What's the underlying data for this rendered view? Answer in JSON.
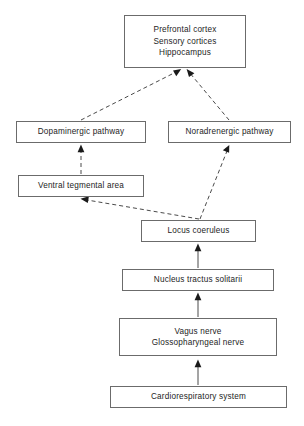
{
  "diagram": {
    "canvas": {
      "width": 304,
      "height": 426
    },
    "style": {
      "box_border_color": "#6b6b6b",
      "box_fill_color": "#ffffff",
      "text_color": "#1d1d1d",
      "edge_color": "#4a4a4a",
      "arrow_color": "#1a1a1a"
    },
    "nodes": [
      {
        "id": "cortex",
        "name": "cortical-targets",
        "lines": [
          "Prefrontal cortex",
          "Sensory cortices",
          "Hippocampus"
        ],
        "x": 124,
        "y": 15,
        "w": 122,
        "h": 53
      },
      {
        "id": "dopaminergic",
        "name": "dopaminergic-pathway",
        "lines": [
          "Dopaminergic pathway"
        ],
        "x": 16,
        "y": 121,
        "w": 130,
        "h": 22
      },
      {
        "id": "noradrenergic",
        "name": "noradrenergic-pathway",
        "lines": [
          "Noradrenergic pathway"
        ],
        "x": 168,
        "y": 121,
        "w": 123,
        "h": 22
      },
      {
        "id": "vta",
        "name": "ventral-tegmental-area",
        "lines": [
          "Ventral tegmental area"
        ],
        "x": 18,
        "y": 175,
        "w": 126,
        "h": 22
      },
      {
        "id": "locus",
        "name": "locus-coeruleus",
        "lines": [
          "Locus coeruleus"
        ],
        "x": 141,
        "y": 220,
        "w": 115,
        "h": 22
      },
      {
        "id": "nts",
        "name": "nucleus-tractus-solitarii",
        "lines": [
          "Nucleus tractus solitarii"
        ],
        "x": 122,
        "y": 269,
        "w": 152,
        "h": 22
      },
      {
        "id": "nerves",
        "name": "cranial-nerves",
        "lines": [
          "Vagus nerve",
          "Glossopharyngeal nerve"
        ],
        "x": 119,
        "y": 318,
        "w": 158,
        "h": 38
      },
      {
        "id": "cardio",
        "name": "cardiorespiratory-system",
        "lines": [
          "Cardiorespiratory system"
        ],
        "x": 110,
        "y": 386,
        "w": 177,
        "h": 22
      }
    ],
    "edges": [
      {
        "id": "e1",
        "name": "edge-dopaminergic-to-cortex",
        "from": "dopaminergic",
        "to": "cortex",
        "style": "dashed",
        "arrow": "to"
      },
      {
        "id": "e2",
        "name": "edge-noradrenergic-to-cortex",
        "from": "noradrenergic",
        "to": "cortex",
        "style": "dashed",
        "arrow": "to"
      },
      {
        "id": "e3",
        "name": "edge-vta-to-dopaminergic",
        "from": "vta",
        "to": "dopaminergic",
        "style": "dashed",
        "arrow": "to"
      },
      {
        "id": "e4",
        "name": "edge-locus-to-noradrenergic",
        "from": "locus",
        "to": "noradrenergic",
        "style": "dashed",
        "arrow": "to"
      },
      {
        "id": "e5",
        "name": "edge-locus-to-vta",
        "from": "locus",
        "to": "vta",
        "style": "dashed",
        "arrow": "to"
      },
      {
        "id": "e6",
        "name": "edge-nts-to-locus",
        "from": "nts",
        "to": "locus",
        "style": "solid",
        "arrow": "to"
      },
      {
        "id": "e7",
        "name": "edge-nerves-to-nts",
        "from": "nerves",
        "to": "nts",
        "style": "solid",
        "arrow": "to"
      },
      {
        "id": "e8",
        "name": "edge-cardio-to-nerves",
        "from": "cardio",
        "to": "nerves",
        "style": "solid",
        "arrow": "to"
      }
    ]
  }
}
